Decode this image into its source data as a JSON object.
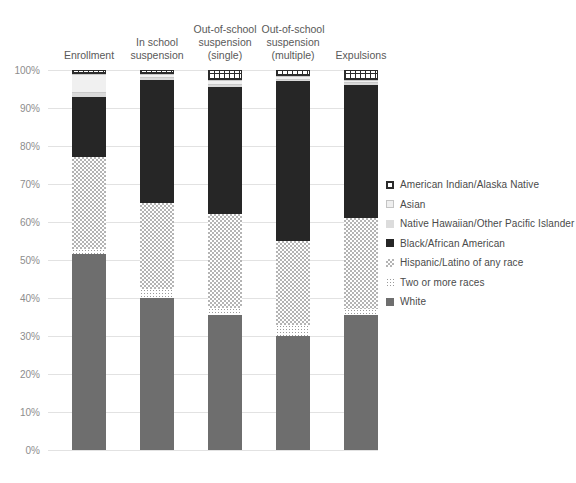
{
  "chart_data": {
    "type": "bar",
    "title": "",
    "subtitle": "",
    "xlabel": "",
    "ylabel": "",
    "ylim": [
      0,
      100
    ],
    "grid": true,
    "stacked": true,
    "stack_total": "100%",
    "legend_position": "right",
    "categories": [
      "Enrollment",
      "In school\nsuspension",
      "Out-of-school\nsuspension\n(single)",
      "Out-of-school\nsuspension\n(multiple)",
      "Expulsions"
    ],
    "ytick_labels": [
      "0%",
      "10%",
      "20%",
      "30%",
      "40%",
      "50%",
      "60%",
      "70%",
      "80%",
      "90%",
      "100%"
    ],
    "ytick_values": [
      0,
      10,
      20,
      30,
      40,
      50,
      60,
      70,
      80,
      90,
      100
    ],
    "series": [
      {
        "name": "White",
        "key": "white",
        "color": "#6e6e6e",
        "pattern": "solid",
        "values": [
          51.5,
          40.0,
          35.5,
          30.0,
          35.5
        ]
      },
      {
        "name": "Two or more races",
        "key": "two",
        "color": "#ffffff",
        "pattern": "fine-dots",
        "values": [
          1.5,
          2.5,
          2.0,
          3.0,
          1.5
        ]
      },
      {
        "name": "Hispanic/Latino of any race",
        "key": "hispanic",
        "color": "#b4b4b4",
        "pattern": "checkerboard",
        "values": [
          24.0,
          22.5,
          24.5,
          22.0,
          24.0
        ]
      },
      {
        "name": "Black/African American",
        "key": "black",
        "color": "#262626",
        "pattern": "solid",
        "values": [
          16.0,
          32.5,
          33.5,
          42.0,
          35.0
        ]
      },
      {
        "name": "Native Hawaiian/Other Pacific Islander",
        "key": "nhpi",
        "color": "#d9d9d9",
        "pattern": "solid-light",
        "values": [
          1.0,
          0.5,
          0.5,
          0.5,
          0.5
        ]
      },
      {
        "name": "Asian",
        "key": "asian",
        "color": "#f0f0f0",
        "pattern": "horizontal-line",
        "values": [
          5.0,
          1.0,
          1.5,
          1.0,
          1.0
        ]
      },
      {
        "name": "American Indian/Alaska Native",
        "key": "amind",
        "color": "#ffffff",
        "pattern": "grid-hatch",
        "values": [
          1.0,
          1.0,
          2.5,
          1.5,
          2.5
        ]
      }
    ]
  },
  "legend": {
    "items": [
      {
        "label": "American Indian/Alaska Native",
        "key": "amind"
      },
      {
        "label": "Asian",
        "key": "asian"
      },
      {
        "label": "Native Hawaiian/Other Pacific Islander",
        "key": "nhpi"
      },
      {
        "label": "Black/African American",
        "key": "black"
      },
      {
        "label": "Hispanic/Latino of any race",
        "key": "hispanic"
      },
      {
        "label": "Two or more races",
        "key": "two"
      },
      {
        "label": "White",
        "key": "white"
      }
    ]
  }
}
